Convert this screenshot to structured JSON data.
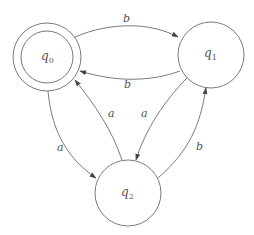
{
  "diagram": {
    "type": "finite-automaton",
    "states": [
      {
        "id": "q0",
        "name": "q",
        "sub": "0",
        "accepting": true,
        "cx": 47,
        "cy": 57
      },
      {
        "id": "q1",
        "name": "q",
        "sub": "1",
        "accepting": false,
        "cx": 211,
        "cy": 55
      },
      {
        "id": "q2",
        "name": "q",
        "sub": "2",
        "accepting": false,
        "cx": 128,
        "cy": 193
      }
    ],
    "transitions": [
      {
        "from": "q0",
        "to": "q1",
        "symbol": "b"
      },
      {
        "from": "q1",
        "to": "q0",
        "symbol": "b"
      },
      {
        "from": "q2",
        "to": "q0",
        "symbol": "a"
      },
      {
        "from": "q1",
        "to": "q2",
        "symbol": "a"
      },
      {
        "from": "q0",
        "to": "q2",
        "symbol": "a"
      },
      {
        "from": "q2",
        "to": "q1",
        "symbol": "b"
      }
    ],
    "colors": {
      "stroke": "#6b6b6b",
      "text": "#555555",
      "background": "#ffffff"
    }
  }
}
